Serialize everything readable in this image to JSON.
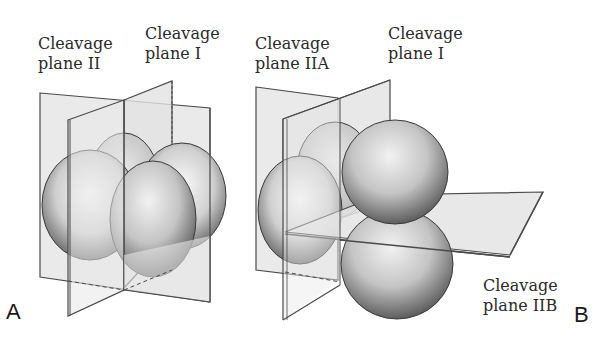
{
  "figure": {
    "panels": [
      {
        "letter": "A",
        "labels": {
          "plane_ii_line1": "Cleavage",
          "plane_ii_line2": "plane II",
          "plane_i_line1": "Cleavage",
          "plane_i_line2": "plane I"
        }
      },
      {
        "letter": "B",
        "labels": {
          "plane_iia_line1": "Cleavage",
          "plane_iia_line2": "plane IIA",
          "plane_i_line1": "Cleavage",
          "plane_i_line2": "plane I",
          "plane_iib_line1": "Cleavage",
          "plane_iib_line2": "plane IIB"
        }
      }
    ],
    "colors": {
      "plane_fill": "#e4e4e4",
      "plane_stroke": "#4a4a4a",
      "cell_light": "#f4f4f4",
      "cell_dark": "#6e6e6e",
      "text": "#2a2a2a"
    }
  }
}
